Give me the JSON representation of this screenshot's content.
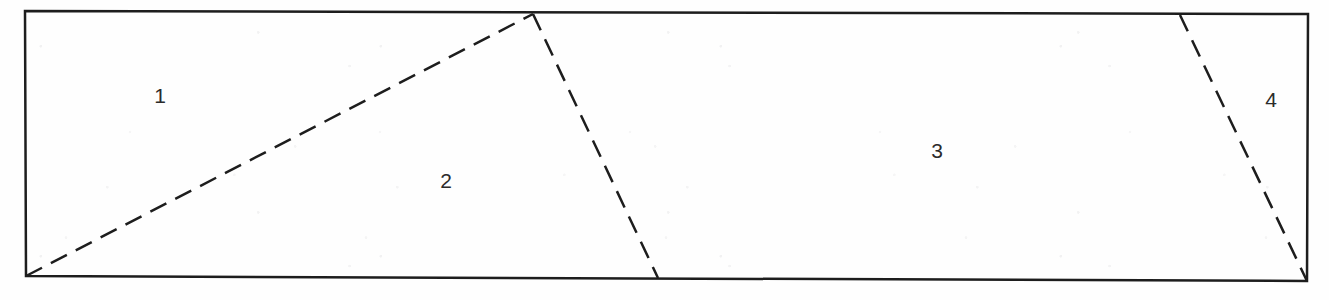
{
  "figure": {
    "kind": "partitioned-rectangle-diagram",
    "background_color": "#fefefe",
    "ink_color": "#1d1d1d",
    "label_color": "#2b2b2b",
    "border": {
      "name": "outer-rectangle",
      "style": "solid",
      "stroke_width": 2.5,
      "corners": {
        "top_left": [
          25,
          11
        ],
        "top_right": [
          1308,
          14
        ],
        "bottom_right": [
          1307,
          281
        ],
        "bottom_left": [
          26,
          276
        ]
      }
    },
    "dashed_lines": [
      {
        "name": "divider-1-2",
        "style": "dashed",
        "stroke_width": 2.5,
        "dash": [
          18,
          10
        ],
        "from": [
          26,
          276
        ],
        "to": [
          533,
          14
        ],
        "separates": [
          "1",
          "2"
        ]
      },
      {
        "name": "divider-2-3",
        "style": "dashed",
        "stroke_width": 2.5,
        "dash": [
          18,
          10
        ],
        "from": [
          533,
          14
        ],
        "to": [
          658,
          278
        ],
        "separates": [
          "2",
          "3"
        ]
      },
      {
        "name": "divider-3-4",
        "style": "dashed",
        "stroke_width": 2.5,
        "dash": [
          18,
          10
        ],
        "from": [
          1180,
          15
        ],
        "to": [
          1307,
          281
        ],
        "separates": [
          "3",
          "4"
        ]
      }
    ],
    "regions": [
      {
        "id": "region-1",
        "label": "1",
        "x": 160,
        "y": 95
      },
      {
        "id": "region-2",
        "label": "2",
        "x": 446,
        "y": 180
      },
      {
        "id": "region-3",
        "label": "3",
        "x": 937,
        "y": 150
      },
      {
        "id": "region-4",
        "label": "4",
        "x": 1271,
        "y": 99
      }
    ]
  }
}
